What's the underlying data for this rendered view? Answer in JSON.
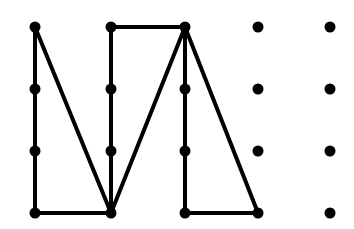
{
  "figure": {
    "type": "dot-grid-line-drawing",
    "canvas": {
      "width": 354,
      "height": 229,
      "background": "#ffffff"
    },
    "style": {
      "dot_color": "#000000",
      "line_color": "#000000",
      "dot_radius": 5.5,
      "line_width": 4
    },
    "grid": {
      "rows": 4,
      "cols": 5,
      "col_x": [
        35,
        111,
        185,
        258,
        330
      ],
      "row_y": [
        27,
        89,
        151,
        213
      ]
    },
    "dots": [
      {
        "name": "dot-r1c1",
        "col": 1,
        "row": 1,
        "x": 35,
        "y": 27,
        "connected": true
      },
      {
        "name": "dot-r1c2",
        "col": 2,
        "row": 1,
        "x": 111,
        "y": 27,
        "connected": true
      },
      {
        "name": "dot-r1c3",
        "col": 3,
        "row": 1,
        "x": 185,
        "y": 27,
        "connected": true
      },
      {
        "name": "dot-r1c4",
        "col": 4,
        "row": 1,
        "x": 258,
        "y": 27,
        "connected": false
      },
      {
        "name": "dot-r1c5",
        "col": 5,
        "row": 1,
        "x": 330,
        "y": 27,
        "connected": false
      },
      {
        "name": "dot-r2c1",
        "col": 1,
        "row": 2,
        "x": 35,
        "y": 89,
        "connected": true
      },
      {
        "name": "dot-r2c2",
        "col": 2,
        "row": 2,
        "x": 111,
        "y": 89,
        "connected": true
      },
      {
        "name": "dot-r2c3",
        "col": 3,
        "row": 2,
        "x": 185,
        "y": 89,
        "connected": true
      },
      {
        "name": "dot-r2c4",
        "col": 4,
        "row": 2,
        "x": 258,
        "y": 89,
        "connected": false
      },
      {
        "name": "dot-r2c5",
        "col": 5,
        "row": 2,
        "x": 330,
        "y": 89,
        "connected": false
      },
      {
        "name": "dot-r3c1",
        "col": 1,
        "row": 3,
        "x": 35,
        "y": 151,
        "connected": true
      },
      {
        "name": "dot-r3c2",
        "col": 2,
        "row": 3,
        "x": 111,
        "y": 151,
        "connected": true
      },
      {
        "name": "dot-r3c3",
        "col": 3,
        "row": 3,
        "x": 185,
        "y": 151,
        "connected": true
      },
      {
        "name": "dot-r3c4",
        "col": 4,
        "row": 3,
        "x": 258,
        "y": 151,
        "connected": false
      },
      {
        "name": "dot-r3c5",
        "col": 5,
        "row": 3,
        "x": 330,
        "y": 151,
        "connected": false
      },
      {
        "name": "dot-r4c1",
        "col": 1,
        "row": 4,
        "x": 35,
        "y": 213,
        "connected": true
      },
      {
        "name": "dot-r4c2",
        "col": 2,
        "row": 4,
        "x": 111,
        "y": 213,
        "connected": true
      },
      {
        "name": "dot-r4c3",
        "col": 3,
        "row": 4,
        "x": 185,
        "y": 213,
        "connected": true
      },
      {
        "name": "dot-r4c4",
        "col": 4,
        "row": 4,
        "x": 258,
        "y": 213,
        "connected": true
      },
      {
        "name": "dot-r4c5",
        "col": 5,
        "row": 4,
        "x": 330,
        "y": 213,
        "connected": false
      }
    ],
    "segments": [
      {
        "name": "segment-left-vertical",
        "from": "r1c1",
        "to": "r4c1",
        "x1": 35,
        "y1": 27,
        "x2": 35,
        "y2": 213
      },
      {
        "name": "segment-n-diagonal",
        "from": "r1c1",
        "to": "r4c2",
        "x1": 35,
        "y1": 27,
        "x2": 111,
        "y2": 213
      },
      {
        "name": "segment-second-vertical",
        "from": "r1c2",
        "to": "r4c2",
        "x1": 111,
        "y1": 27,
        "x2": 111,
        "y2": 213
      },
      {
        "name": "segment-bottom-left-horizontal",
        "from": "r4c1",
        "to": "r4c2",
        "x1": 35,
        "y1": 213,
        "x2": 111,
        "y2": 213
      },
      {
        "name": "segment-top-horizontal",
        "from": "r1c2",
        "to": "r1c3",
        "x1": 111,
        "y1": 27,
        "x2": 185,
        "y2": 27
      },
      {
        "name": "segment-v-diagonal",
        "from": "r4c2",
        "to": "r1c3",
        "x1": 111,
        "y1": 213,
        "x2": 185,
        "y2": 27
      },
      {
        "name": "segment-third-vertical",
        "from": "r1c3",
        "to": "r4c3",
        "x1": 185,
        "y1": 27,
        "x2": 185,
        "y2": 213
      },
      {
        "name": "segment-right-diagonal",
        "from": "r1c3",
        "to": "r4c4",
        "x1": 185,
        "y1": 27,
        "x2": 258,
        "y2": 213
      },
      {
        "name": "segment-bottom-right-horizontal",
        "from": "r4c3",
        "to": "r4c4",
        "x1": 185,
        "y1": 213,
        "x2": 258,
        "y2": 213
      }
    ]
  }
}
